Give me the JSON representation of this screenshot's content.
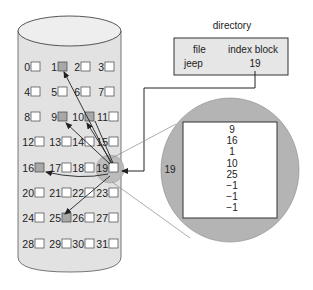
{
  "directory": {
    "title": "directory",
    "headers": {
      "file": "file",
      "index_block": "index block"
    },
    "row": {
      "file": "jeep",
      "index_block": "19"
    }
  },
  "disk": {
    "blocks": [
      "0",
      "1",
      "2",
      "3",
      "4",
      "5",
      "6",
      "7",
      "8",
      "9",
      "10",
      "11",
      "12",
      "13",
      "14",
      "15",
      "16",
      "17",
      "18",
      "19",
      "20",
      "21",
      "22",
      "23",
      "24",
      "25",
      "26",
      "27",
      "28",
      "29",
      "30",
      "31"
    ],
    "used_blocks": [
      1,
      9,
      10,
      16,
      25
    ],
    "index_block": 19
  },
  "magnified": {
    "label": "19",
    "entries": [
      "9",
      "16",
      "1",
      "10",
      "25",
      "−1",
      "−1",
      "−1"
    ]
  },
  "colors": {
    "cylinder_fill": "#e2e2e2",
    "used_block": "#a8a8a8",
    "magnifier": "#b4b4b4",
    "line": "#222222",
    "guide": "#8a8a8a"
  }
}
